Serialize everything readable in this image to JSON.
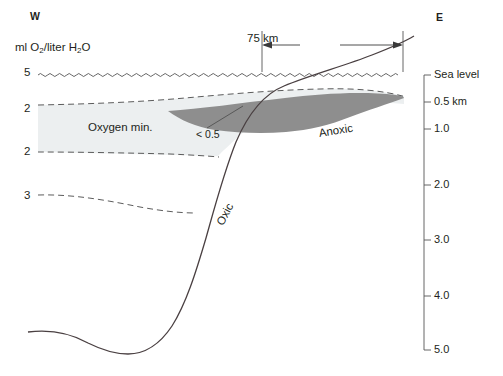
{
  "figure": {
    "type": "cross-section-diagram",
    "title_west": "W",
    "title_east": "E",
    "concentration_axis_label_parts": {
      "lead": "ml O",
      "sub1": "2",
      "mid": "/liter H",
      "sub2": "2",
      "tail": "O"
    },
    "concentration_axis_label_plain": "ml O2/liter H2O"
  },
  "scalebar": {
    "label": "75 km",
    "x_start_px": 262,
    "x_end_px": 403,
    "y_px": 45
  },
  "sea_level": {
    "label": "Sea level",
    "y_px": 75,
    "style": "wavy"
  },
  "oxygen_contours": [
    {
      "value": "5",
      "y_px": 73,
      "note": "sea surface wavy line"
    },
    {
      "value": "2",
      "y_px": 109,
      "note": "top of oxygen minimum zone"
    },
    {
      "value": "2",
      "y_px": 152,
      "note": "base of oxygen minimum zone"
    },
    {
      "value": "3",
      "y_px": 196,
      "note": "deeper oxic contour"
    }
  ],
  "depth_axis": {
    "unit_note": "km below sea level",
    "ticks": [
      {
        "label": "Sea level",
        "value": 0.0,
        "y_px": 75
      },
      {
        "label": "0.5 km",
        "value": 0.5,
        "y_px": 102
      },
      {
        "label": "1.0",
        "value": 1.0,
        "y_px": 129
      },
      {
        "label": "2.0",
        "value": 2.0,
        "y_px": 185
      },
      {
        "label": "3.0",
        "value": 3.0,
        "y_px": 240
      },
      {
        "label": "4.0",
        "value": 4.0,
        "y_px": 296
      },
      {
        "label": "5.0",
        "value": 5.0,
        "y_px": 350
      }
    ],
    "axis_x_px": 424,
    "axis_top_px": 75,
    "axis_bottom_px": 350
  },
  "zones": [
    {
      "name": "oxygen-minimum-zone",
      "label": "Oxygen min.",
      "fill": "#eceff0",
      "label_x_px": 125,
      "label_y_px": 128
    },
    {
      "name": "anoxic-zone",
      "label": "Anoxic",
      "fill": "#8e8e8e",
      "label_x_px": 343,
      "label_y_px": 125
    },
    {
      "name": "oxic-water",
      "label": "Oxic",
      "fill": "#ffffff",
      "label_x_px": 228,
      "label_y_px": 207
    }
  ],
  "annotations": [
    {
      "name": "low-oxygen-callout",
      "label": "< 0.5",
      "label_x_px": 210,
      "label_y_px": 134,
      "leader_to_x_px": 243,
      "leader_to_y_px": 108
    }
  ],
  "colors": {
    "line": "#3a3a3a",
    "dashed_contour": "#4a4a4a",
    "oxygen_min_fill": "#eceff0",
    "anoxic_fill": "#8e8e8e",
    "text": "#231f20",
    "seafloor": "#4a4042"
  }
}
